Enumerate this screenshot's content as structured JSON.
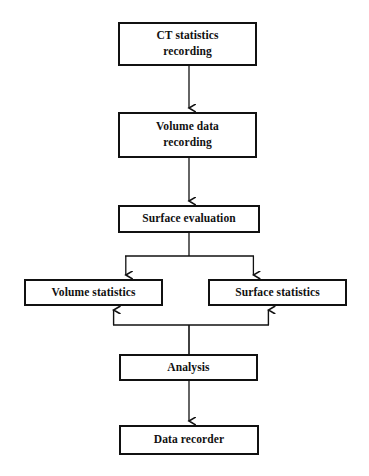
{
  "diagram": {
    "background_color": "#ffffff",
    "line_color": "#111111",
    "text_color": "#111111",
    "nodes": [
      {
        "id": "ct-statistics-recording",
        "label": "CT statistics\nrecording",
        "x": 118,
        "y": 22,
        "w": 139,
        "h": 44
      },
      {
        "id": "volume-data-recording",
        "label": "Volume data\nrecording",
        "x": 118,
        "y": 112,
        "w": 139,
        "h": 46
      },
      {
        "id": "surface-evaluation",
        "label": "Surface evaluation",
        "x": 118,
        "y": 205,
        "w": 142,
        "h": 28
      },
      {
        "id": "volume-statistics",
        "label": "Volume statistics",
        "x": 24,
        "y": 279,
        "w": 139,
        "h": 27
      },
      {
        "id": "surface-statistics",
        "label": "Surface statistics",
        "x": 208,
        "y": 279,
        "w": 139,
        "h": 27
      },
      {
        "id": "analysis",
        "label": "Analysis",
        "x": 119,
        "y": 354,
        "w": 139,
        "h": 27
      },
      {
        "id": "data-recorder",
        "label": "Data recorder",
        "x": 119,
        "y": 425,
        "w": 140,
        "h": 30
      }
    ],
    "connectors": [
      {
        "id": "ct-to-volume-data",
        "from": "ct-statistics-recording",
        "to": "volume-data-recording",
        "direction": "down"
      },
      {
        "id": "volume-data-to-surface-evaluation",
        "from": "volume-data-recording",
        "to": "surface-evaluation",
        "direction": "down"
      },
      {
        "id": "surface-evaluation-to-volume-statistics",
        "from": "surface-evaluation",
        "to": "volume-statistics",
        "direction": "down-branch-left"
      },
      {
        "id": "surface-evaluation-to-surface-statistics",
        "from": "surface-evaluation",
        "to": "surface-statistics",
        "direction": "down-branch-right"
      },
      {
        "id": "analysis-to-volume-statistics",
        "from": "analysis",
        "to": "volume-statistics",
        "direction": "up-branch-left"
      },
      {
        "id": "analysis-to-surface-statistics",
        "from": "analysis",
        "to": "surface-statistics",
        "direction": "up-branch-right"
      },
      {
        "id": "analysis-to-data-recorder",
        "from": "analysis",
        "to": "data-recorder",
        "direction": "down"
      }
    ]
  }
}
